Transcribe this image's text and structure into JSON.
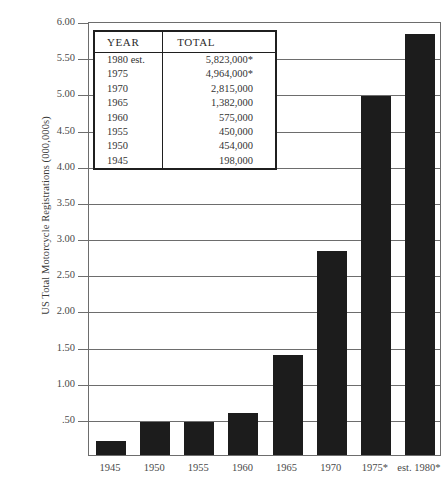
{
  "chart_data": {
    "type": "bar",
    "title": "",
    "xlabel": "",
    "ylabel": "US Total Motorcycle Registrations (000,000s)",
    "categories": [
      "1945",
      "1950",
      "1955",
      "1960",
      "1965",
      "1970",
      "1975*",
      "est. 1980*"
    ],
    "values": [
      0.198,
      0.454,
      0.45,
      0.575,
      1.382,
      2.815,
      4.964,
      5.823
    ],
    "ylim": [
      0,
      6.0
    ],
    "yticks": [
      "6.00",
      "5.50",
      "5.00",
      "4.50",
      "4.00",
      "3.50",
      "3.00",
      "2.50",
      "2.00",
      "1.50",
      "1.00",
      ".50"
    ],
    "ytick_values": [
      6.0,
      5.5,
      5.0,
      4.5,
      4.0,
      3.5,
      3.0,
      2.5,
      2.0,
      1.5,
      1.0,
      0.5
    ],
    "grid": true,
    "legend": "none",
    "bar_color": "#1c1c1c",
    "axis_color": "#6d6d6d"
  },
  "inset_table": {
    "headers": [
      "YEAR",
      "TOTAL"
    ],
    "rows": [
      {
        "year": "1980 est.",
        "total": "5,823,000*"
      },
      {
        "year": "1975",
        "total": "4,964,000*"
      },
      {
        "year": "1970",
        "total": "2,815,000"
      },
      {
        "year": "1965",
        "total": "1,382,000"
      },
      {
        "year": "1960",
        "total": "575,000"
      },
      {
        "year": "1955",
        "total": "450,000"
      },
      {
        "year": "1950",
        "total": "454,000"
      },
      {
        "year": "1945",
        "total": "198,000"
      }
    ]
  }
}
